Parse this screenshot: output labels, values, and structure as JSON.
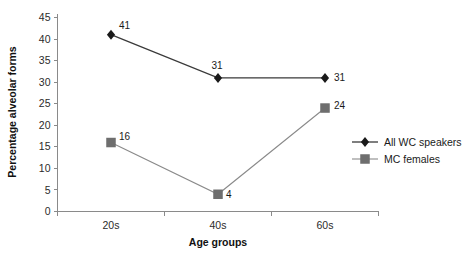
{
  "chart_data": {
    "type": "line",
    "title": "",
    "subtitle": "",
    "xlabel": "Age groups",
    "ylabel": "Percentage alveolar forms",
    "categories": [
      "20s",
      "40s",
      "60s"
    ],
    "ylim": [
      0,
      45
    ],
    "ytick_step": 5,
    "yticks": [
      "0",
      "5",
      "10",
      "15",
      "20",
      "25",
      "30",
      "35",
      "40",
      "45"
    ],
    "grid": false,
    "legend_position": "right-middle",
    "series": [
      {
        "name": "All WC speakers",
        "marker": "diamond",
        "color": "#1a1a1a",
        "line_color": "#3a3a3a",
        "values": [
          41,
          31,
          31
        ],
        "labels": [
          "41",
          "31",
          "31"
        ]
      },
      {
        "name": "MC females",
        "marker": "square",
        "color": "#6e6e6e",
        "line_color": "#8a8a8a",
        "values": [
          16,
          4,
          24
        ],
        "labels": [
          "16",
          "4",
          "24"
        ]
      }
    ]
  },
  "legend": {
    "entries": [
      {
        "label": "All WC speakers"
      },
      {
        "label": "MC females"
      }
    ]
  },
  "axes": {
    "y_title": "Percentage alveolar forms",
    "x_title": "Age groups"
  }
}
